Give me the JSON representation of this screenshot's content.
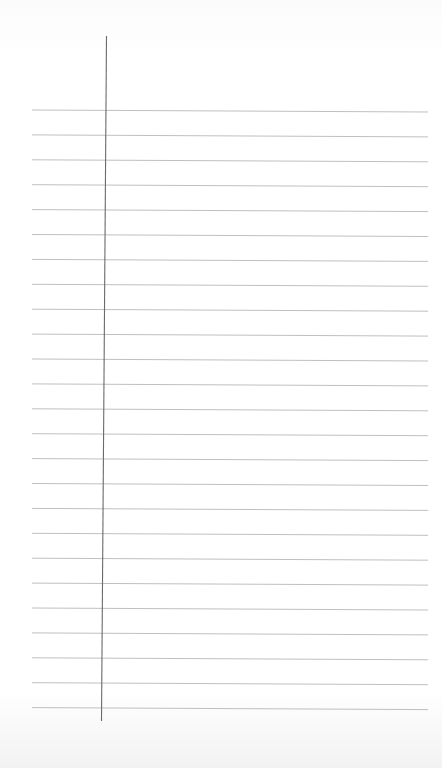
{
  "page": {
    "kind": "lined-paper",
    "rule_count": 25,
    "has_margin_line": true,
    "text_content": "",
    "colors": {
      "paper": "#ffffff",
      "rule": "#b8b8b8",
      "margin_line": "#6a6a6a"
    }
  }
}
